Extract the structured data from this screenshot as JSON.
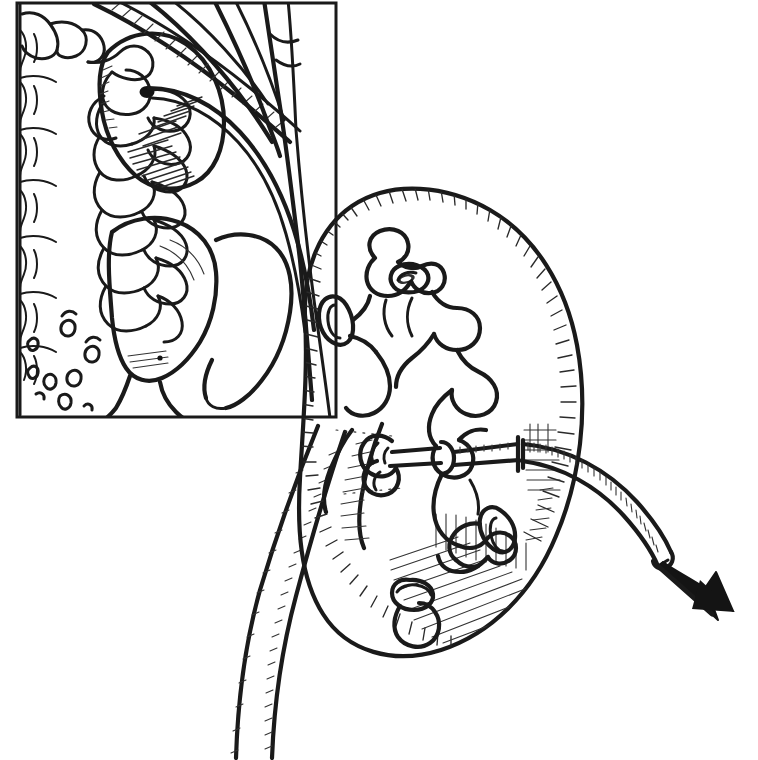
{
  "figure": {
    "caption": "",
    "background_color": "#ffffff",
    "ink_color": "#1a1a1a",
    "style": "black-and-white pen-and-ink line drawing with hatch shading",
    "width": 758,
    "height": 760
  },
  "inset_panel": {
    "name": "anatomical-context-inset",
    "frame": {
      "x": 16,
      "y": 2,
      "width": 321,
      "height": 416,
      "stroke": "#1a1a1a",
      "stroke_width": 3
    },
    "position": "top-left",
    "structures": [
      {
        "id": "vertebral-column",
        "label": "Lumbar vertebral column",
        "side": "left edge"
      },
      {
        "id": "ribs",
        "label": "Lower ribs (11th and 12th)",
        "side": "upper right"
      },
      {
        "id": "kidney-small",
        "label": "Kidney (posterior view)",
        "side": "upper middle"
      },
      {
        "id": "nephrostomy-tube-entry",
        "label": "Nephrostomy tube entering kidney",
        "side": "center"
      },
      {
        "id": "psoas-muscle",
        "label": "Psoas muscle",
        "side": "lower middle"
      },
      {
        "id": "quadratus-lumborum",
        "label": "Quadratus lumborum",
        "side": "lower right"
      },
      {
        "id": "lumbar-vessels",
        "label": "Lumbar vessel cross-sections",
        "side": "lower left"
      }
    ]
  },
  "main_figure": {
    "name": "kidney-cutaway",
    "structures": [
      {
        "id": "renal-capsule",
        "label": "Renal capsule outline"
      },
      {
        "id": "renal-cortex-hatching",
        "label": "Cortex hatch shading"
      },
      {
        "id": "calyceal-system",
        "label": "Renal collecting system (major and minor calyces)"
      },
      {
        "id": "renal-pelvis",
        "label": "Renal pelvis"
      },
      {
        "id": "ureter",
        "label": "Ureter"
      },
      {
        "id": "nephrostomy-tube",
        "label": "Nephrostomy catheter"
      },
      {
        "id": "tube-tip",
        "label": "Catheter tip within calyx"
      },
      {
        "id": "direction-arrow",
        "label": "Arrow indicating catheter exit direction"
      }
    ]
  },
  "annotations": {
    "arrow_direction": "down-right",
    "arrow_meaning": "direction of tube exit from the body"
  }
}
